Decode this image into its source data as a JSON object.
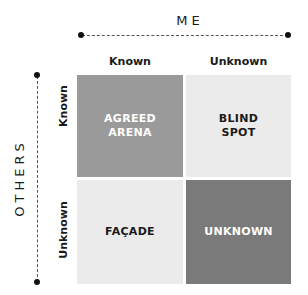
{
  "axes": {
    "top_title": "ME",
    "left_title": "OTHERS",
    "columns": [
      "Known",
      "Unknown"
    ],
    "rows": [
      "Known",
      "Unknown"
    ]
  },
  "quadrants": {
    "top_left": {
      "label": "AGREED\nARENA",
      "color": "#9a9a9a"
    },
    "top_right": {
      "label": "BLIND\nSPOT",
      "color": "#ebebeb"
    },
    "bottom_left": {
      "label": "FAÇADE",
      "color": "#ebebeb"
    },
    "bottom_right": {
      "label": "UNKNOWN",
      "color": "#7a7a7a"
    }
  }
}
